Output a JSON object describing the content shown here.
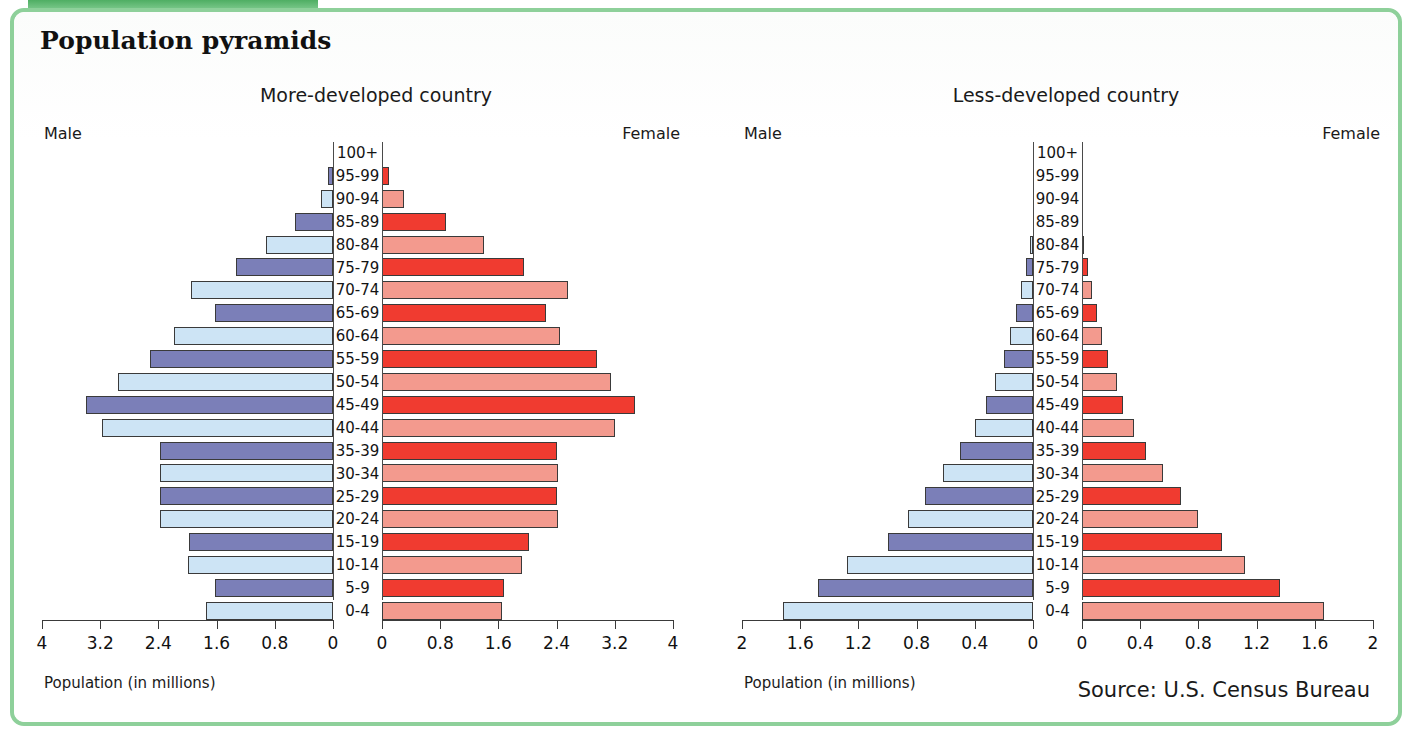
{
  "page": {
    "title": "Population pyramids",
    "source": "Source: U.S. Census Bureau",
    "accent_green": "#8ed09a",
    "male_dark": "#7b7fb8",
    "male_light": "#cde4f5",
    "female_dark": "#f03b30",
    "female_light": "#f39a8e"
  },
  "charts": [
    {
      "title": "More-developed country",
      "male_label": "Male",
      "female_label": "Female",
      "xcaption": "Population (in millions)",
      "ticks": [
        "4",
        "3.2",
        "2.4",
        "1.6",
        "0.8",
        "0"
      ],
      "ticks_right": [
        "0",
        "0.8",
        "1.6",
        "2.4",
        "3.2",
        "4"
      ]
    },
    {
      "title": "Less-developed country",
      "male_label": "Male",
      "female_label": "Female",
      "xcaption": "Population (in millions)",
      "ticks": [
        "2",
        "1.6",
        "1.2",
        "0.8",
        "0.4",
        "0"
      ],
      "ticks_right": [
        "0",
        "0.4",
        "0.8",
        "1.2",
        "1.6",
        "2"
      ]
    }
  ],
  "chart_data": [
    {
      "type": "bar",
      "subtype": "population-pyramid",
      "title": "More-developed country",
      "xlabel": "Population (in millions)",
      "ylabel": "Age group",
      "xlim": [
        0,
        4
      ],
      "xticks": [
        0,
        0.8,
        1.6,
        2.4,
        3.2,
        4
      ],
      "grid": false,
      "categories": [
        "100+",
        "95-99",
        "90-94",
        "85-89",
        "80-84",
        "75-79",
        "70-74",
        "65-69",
        "60-64",
        "55-59",
        "50-54",
        "45-49",
        "40-44",
        "35-39",
        "30-34",
        "25-29",
        "20-24",
        "15-19",
        "10-14",
        "5-9",
        "0-4"
      ],
      "series": [
        {
          "name": "Male",
          "values": [
            0.0,
            0.07,
            0.17,
            0.52,
            0.92,
            1.33,
            1.95,
            1.62,
            2.18,
            2.52,
            2.95,
            3.4,
            3.18,
            2.38,
            2.38,
            2.38,
            2.38,
            1.98,
            2.0,
            1.62,
            1.75
          ]
        },
        {
          "name": "Female",
          "values": [
            0.0,
            0.1,
            0.3,
            0.88,
            1.4,
            1.95,
            2.55,
            2.25,
            2.45,
            2.95,
            3.15,
            3.48,
            3.2,
            2.4,
            2.42,
            2.4,
            2.42,
            2.02,
            1.92,
            1.68,
            1.65
          ]
        }
      ]
    },
    {
      "type": "bar",
      "subtype": "population-pyramid",
      "title": "Less-developed country",
      "xlabel": "Population (in millions)",
      "ylabel": "Age group",
      "xlim": [
        0,
        2
      ],
      "xticks": [
        0,
        0.4,
        0.8,
        1.2,
        1.6,
        2
      ],
      "grid": false,
      "categories": [
        "100+",
        "95-99",
        "90-94",
        "85-89",
        "80-84",
        "75-79",
        "70-74",
        "65-69",
        "60-64",
        "55-59",
        "50-54",
        "45-49",
        "40-44",
        "35-39",
        "30-34",
        "25-29",
        "20-24",
        "15-19",
        "10-14",
        "5-9",
        "0-4"
      ],
      "series": [
        {
          "name": "Male",
          "values": [
            0.0,
            0.0,
            0.0,
            0.0,
            0.02,
            0.05,
            0.08,
            0.12,
            0.16,
            0.2,
            0.26,
            0.32,
            0.4,
            0.5,
            0.62,
            0.74,
            0.86,
            1.0,
            1.28,
            1.48,
            1.72
          ]
        },
        {
          "name": "Female",
          "values": [
            0.0,
            0.0,
            0.0,
            0.0,
            0.01,
            0.04,
            0.07,
            0.1,
            0.14,
            0.18,
            0.24,
            0.28,
            0.36,
            0.44,
            0.56,
            0.68,
            0.8,
            0.96,
            1.12,
            1.36,
            1.66
          ]
        }
      ]
    }
  ]
}
